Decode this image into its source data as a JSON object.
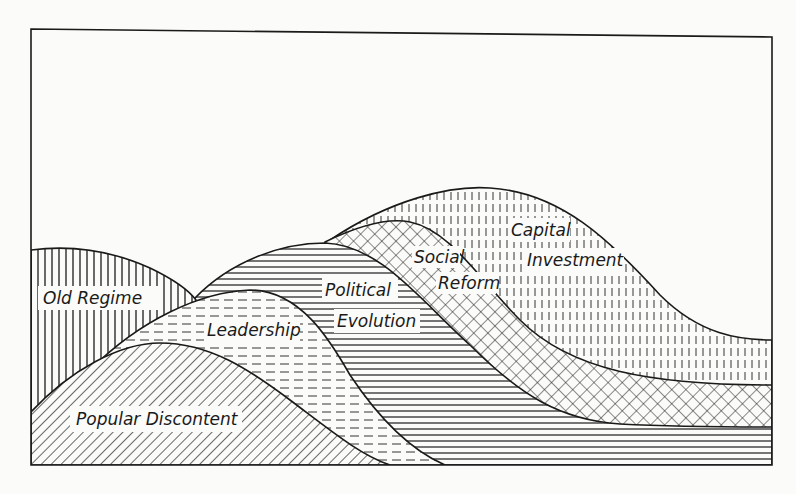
{
  "diagram": {
    "type": "stacked-wave-diagram",
    "colors": {
      "ink": "#1a1a1a",
      "paper": "#fbfbf9"
    },
    "layers": [
      {
        "id": "old-regime",
        "label_lines": [
          "Old  Regime"
        ],
        "pattern": "vertical-lines"
      },
      {
        "id": "popular-discontent",
        "label_lines": [
          "Popular Discontent"
        ],
        "pattern": "diagonal-lines"
      },
      {
        "id": "leadership",
        "label_lines": [
          "Leadership"
        ],
        "pattern": "dashed-horizontal"
      },
      {
        "id": "political-evolution",
        "label_lines": [
          "Political",
          "Evolution"
        ],
        "pattern": "horizontal-lines"
      },
      {
        "id": "social-reform",
        "label_lines": [
          "Social",
          "Reform"
        ],
        "pattern": "cross-hatch"
      },
      {
        "id": "capital-investment",
        "label_lines": [
          "Capital",
          "Investment"
        ],
        "pattern": "dashed-vertical"
      }
    ]
  }
}
